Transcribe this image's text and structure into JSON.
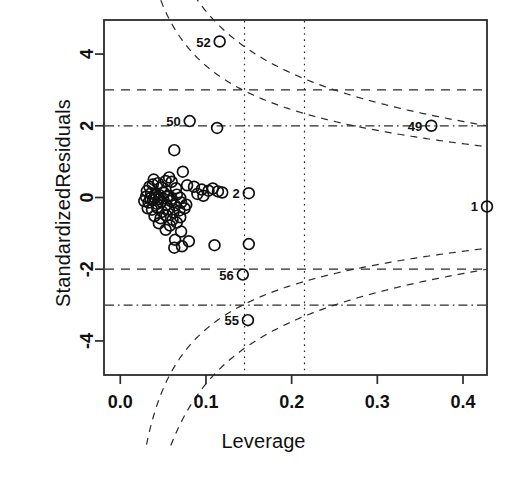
{
  "chart_data": {
    "type": "scatter",
    "title": "",
    "xlabel": "Leverage",
    "ylabel": "StandardizedResiduals",
    "xlim": [
      -0.019,
      0.428
    ],
    "ylim": [
      -4.95,
      4.95
    ],
    "xticks": [
      0.0,
      0.1,
      0.2,
      0.3,
      0.4
    ],
    "xticklabels": [
      "0.0",
      "0.1",
      "0.2",
      "0.3",
      "0.4"
    ],
    "yticks": [
      4,
      2,
      0,
      -2,
      -4
    ],
    "yticklabels": [
      "4",
      "2",
      "0",
      "-2",
      "-4"
    ],
    "grid": false,
    "legend": null,
    "hlines": [
      {
        "y": 3,
        "style": "dashed"
      },
      {
        "y": 2,
        "style": "dotdash"
      },
      {
        "y": -2,
        "style": "dashed"
      },
      {
        "y": -3,
        "style": "dotdash"
      }
    ],
    "vlines": [
      {
        "x": 0.145,
        "style": "dotted"
      },
      {
        "x": 0.215,
        "style": "dotted"
      }
    ],
    "cook_curves": [
      {
        "name": "cook-0.5-upper",
        "style": "dashed"
      },
      {
        "name": "cook-1.0-upper",
        "style": "dashed"
      },
      {
        "name": "cook-0.5-lower",
        "style": "dashed"
      },
      {
        "name": "cook-1.0-lower",
        "style": "dashed"
      }
    ],
    "point_labels": [
      {
        "id": "52",
        "x": 0.116,
        "y": 4.35
      },
      {
        "id": "50",
        "x": 0.081,
        "y": 2.13
      },
      {
        "id": "2",
        "x": 0.15,
        "y": 0.12
      },
      {
        "id": "49",
        "x": 0.363,
        "y": 2.0
      },
      {
        "id": "1",
        "x": 0.428,
        "y": -0.25
      },
      {
        "id": "56",
        "x": 0.143,
        "y": -2.15
      },
      {
        "id": "55",
        "x": 0.149,
        "y": -3.42
      }
    ],
    "points": [
      [
        0.116,
        4.35
      ],
      [
        0.081,
        2.13
      ],
      [
        0.113,
        1.94
      ],
      [
        0.063,
        1.32
      ],
      [
        0.073,
        0.72
      ],
      [
        0.053,
        0.46
      ],
      [
        0.06,
        0.44
      ],
      [
        0.044,
        0.4
      ],
      [
        0.038,
        0.36
      ],
      [
        0.034,
        0.3
      ],
      [
        0.048,
        0.28
      ],
      [
        0.065,
        0.26
      ],
      [
        0.078,
        0.34
      ],
      [
        0.086,
        0.3
      ],
      [
        0.095,
        0.22
      ],
      [
        0.103,
        0.19
      ],
      [
        0.108,
        0.25
      ],
      [
        0.114,
        0.17
      ],
      [
        0.119,
        0.14
      ],
      [
        0.15,
        0.12
      ],
      [
        0.031,
        0.18
      ],
      [
        0.036,
        0.12
      ],
      [
        0.041,
        0.1
      ],
      [
        0.046,
        0.06
      ],
      [
        0.051,
        0.13
      ],
      [
        0.056,
        0.05
      ],
      [
        0.03,
        0.02
      ],
      [
        0.035,
        -0.02
      ],
      [
        0.04,
        0.0
      ],
      [
        0.045,
        -0.05
      ],
      [
        0.05,
        -0.03
      ],
      [
        0.055,
        0.02
      ],
      [
        0.06,
        -0.04
      ],
      [
        0.066,
        0.08
      ],
      [
        0.07,
        -0.01
      ],
      [
        0.028,
        -0.1
      ],
      [
        0.033,
        -0.14
      ],
      [
        0.038,
        -0.08
      ],
      [
        0.043,
        -0.18
      ],
      [
        0.048,
        -0.12
      ],
      [
        0.054,
        -0.2
      ],
      [
        0.059,
        -0.1
      ],
      [
        0.064,
        -0.22
      ],
      [
        0.071,
        -0.14
      ],
      [
        0.077,
        -0.2
      ],
      [
        0.032,
        -0.3
      ],
      [
        0.037,
        -0.34
      ],
      [
        0.043,
        -0.28
      ],
      [
        0.049,
        -0.4
      ],
      [
        0.056,
        -0.33
      ],
      [
        0.062,
        -0.42
      ],
      [
        0.069,
        -0.36
      ],
      [
        0.075,
        -0.3
      ],
      [
        0.04,
        -0.52
      ],
      [
        0.047,
        -0.58
      ],
      [
        0.054,
        -0.5
      ],
      [
        0.061,
        -0.62
      ],
      [
        0.07,
        -0.55
      ],
      [
        0.045,
        -0.72
      ],
      [
        0.058,
        -0.78
      ],
      [
        0.066,
        -0.7
      ],
      [
        0.053,
        -0.9
      ],
      [
        0.071,
        -0.95
      ],
      [
        0.064,
        -1.18
      ],
      [
        0.08,
        -1.22
      ],
      [
        0.063,
        -1.4
      ],
      [
        0.072,
        -1.36
      ],
      [
        0.11,
        -1.33
      ],
      [
        0.15,
        -1.3
      ],
      [
        0.143,
        -2.15
      ],
      [
        0.149,
        -3.42
      ],
      [
        0.039,
        0.5
      ],
      [
        0.057,
        0.56
      ],
      [
        0.09,
        0.1
      ],
      [
        0.097,
        0.05
      ],
      [
        0.363,
        2.0
      ],
      [
        0.428,
        -0.25
      ]
    ]
  },
  "axes": {
    "tick_font_weight": "bold"
  }
}
